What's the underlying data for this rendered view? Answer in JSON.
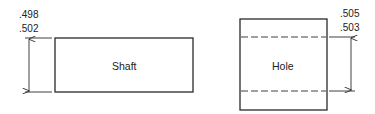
{
  "shaft": {
    "label": "Shaft",
    "dim_upper": ".498",
    "dim_lower": ".502"
  },
  "hole": {
    "label": "Hole",
    "dim_upper": ".505",
    "dim_lower": ".503"
  },
  "colors": {
    "line": "#2a2a2a",
    "background": "#ffffff"
  }
}
